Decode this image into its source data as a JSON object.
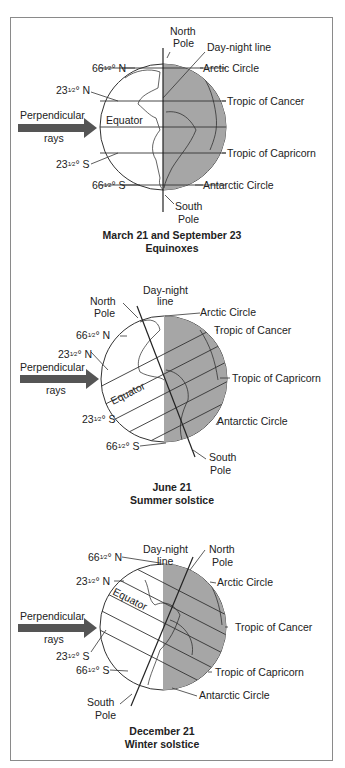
{
  "panels": [
    {
      "caption_line1": "March 21 and September 23",
      "caption_line2": "Equinoxes",
      "labels": {
        "north_pole_1": "North",
        "north_pole_2": "Pole",
        "day_night": "Day-night line",
        "lat66n": "66",
        "lat23n": "23",
        "lat23s": "23",
        "lat66s": "66",
        "arctic": "Arctic Circle",
        "cancer": "Tropic of Cancer",
        "capricorn": "Tropic of Capricorn",
        "antarctic": "Antarctic Circle",
        "equator": "Equator",
        "rays_1": "Perpendicular",
        "rays_2": "rays",
        "south_pole_1": "South",
        "south_pole_2": "Pole"
      }
    },
    {
      "caption_line1": "June 21",
      "caption_line2": "Summer solstice",
      "labels": {
        "north_pole_1": "North",
        "north_pole_2": "Pole",
        "day_night_1": "Day-night",
        "day_night_2": "line",
        "lat66n": "66",
        "lat23n": "23",
        "lat23s": "23",
        "lat66s": "66",
        "arctic": "Arctic Circle",
        "cancer": "Tropic of Cancer",
        "capricorn": "Tropic of Capricorn",
        "antarctic": "Antarctic Circle",
        "equator": "Equator",
        "rays_1": "Perpendicular",
        "rays_2": "rays",
        "south_pole_1": "South",
        "south_pole_2": "Pole"
      }
    },
    {
      "caption_line1": "December 21",
      "caption_line2": "Winter solstice",
      "labels": {
        "north_pole_1": "North",
        "north_pole_2": "Pole",
        "day_night_1": "Day-night",
        "day_night_2": "line",
        "lat66n": "66",
        "lat23n": "23",
        "lat23s": "23",
        "lat66s": "66",
        "arctic": "Arctic Circle",
        "cancer": "Tropic of Cancer",
        "capricorn": "Tropic of Capricorn",
        "antarctic": "Antarctic Circle",
        "equator": "Equator",
        "rays_1": "Perpendicular",
        "rays_2": "rays",
        "south_pole_1": "South",
        "south_pole_2": "Pole"
      }
    }
  ],
  "common": {
    "half": "1⁄2",
    "deg_n": "° N",
    "deg_s": "° S"
  },
  "colors": {
    "night": "#a6a6a6",
    "arrow": "#555555",
    "line": "#333333",
    "frame": "#8a8a8a"
  }
}
